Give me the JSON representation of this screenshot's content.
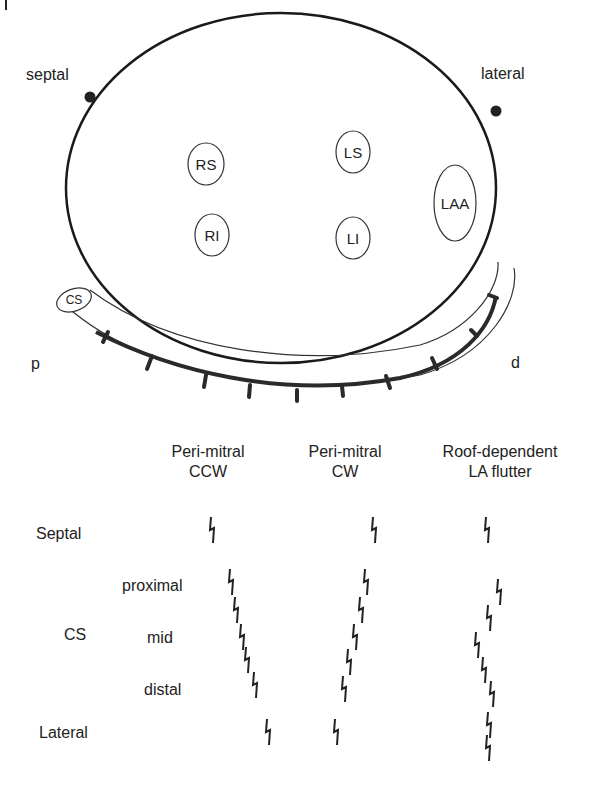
{
  "panel_letter": "I",
  "anatomy": {
    "septal_label": "septal",
    "lateral_label": "lateral",
    "veins": [
      {
        "label": "RS",
        "cx": 206,
        "cy": 164
      },
      {
        "label": "RI",
        "cx": 212,
        "cy": 235
      },
      {
        "label": "LS",
        "cx": 353,
        "cy": 152
      },
      {
        "label": "LI",
        "cx": 353,
        "cy": 238
      },
      {
        "label": "LAA",
        "cx": 455,
        "cy": 203
      }
    ],
    "cs_label": "CS",
    "proximal_label": "p",
    "distal_label": "d"
  },
  "table": {
    "columns": [
      "Peri-mitral\nCCW",
      "Peri-mitral\nCW",
      "Roof-dependent\nLA flutter"
    ],
    "col1": "Peri-mitral",
    "col1b": "CCW",
    "col2": "Peri-mitral",
    "col2b": "CW",
    "col3": "Roof-dependent",
    "col3b": "LA flutter",
    "rows": {
      "septal": "Septal",
      "cs": "CS",
      "proximal": "proximal",
      "mid": "mid",
      "distal": "distal",
      "lateral": "Lateral"
    }
  },
  "activation_markers": {
    "ccw": [
      [
        212,
        530
      ],
      [
        231,
        582
      ],
      [
        236,
        610
      ],
      [
        242,
        637
      ],
      [
        247,
        660
      ],
      [
        255,
        685
      ],
      [
        268,
        732
      ]
    ],
    "cw": [
      [
        374,
        530
      ],
      [
        366,
        582
      ],
      [
        361,
        610
      ],
      [
        355,
        637
      ],
      [
        349,
        662
      ],
      [
        344,
        689
      ],
      [
        336,
        732
      ]
    ],
    "roof": [
      [
        487,
        530
      ],
      [
        499,
        592
      ],
      [
        489,
        618
      ],
      [
        477,
        645
      ],
      [
        484,
        670
      ],
      [
        492,
        694
      ],
      [
        489,
        725
      ],
      [
        488,
        748
      ]
    ]
  }
}
